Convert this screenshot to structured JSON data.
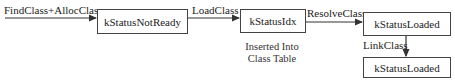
{
  "diagram": {
    "type": "state-flow",
    "states": [
      {
        "id": "s1",
        "label": "kStatusNotReady"
      },
      {
        "id": "s2",
        "label": "kStatusIdx"
      },
      {
        "id": "s3",
        "label": "kStatusLoaded"
      },
      {
        "id": "s4",
        "label": "kStatusLoaded"
      }
    ],
    "transitions": [
      {
        "from": "start",
        "to": "s1",
        "label": "FindClass+AllocClass"
      },
      {
        "from": "s1",
        "to": "s2",
        "label": "LoadClass"
      },
      {
        "from": "s2",
        "to": "s3",
        "label": "ResolveClass"
      },
      {
        "from": "s3",
        "to": "s4",
        "label": "LinkClass"
      }
    ],
    "annotations": [
      {
        "target": "s2",
        "line1": "Inserted Into",
        "line2": "Class Table"
      }
    ],
    "colors": {
      "line": "#333333",
      "box_border": "#444444",
      "text": "#222222"
    }
  }
}
